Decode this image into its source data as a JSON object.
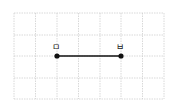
{
  "diagram": {
    "type": "grid-line-segment",
    "grid": {
      "columns": 7,
      "rows": 4,
      "x_lines": [
        14,
        35.5,
        57,
        78.5,
        100,
        121,
        142.5,
        164
      ],
      "y_lines": [
        13,
        35,
        56,
        78,
        99
      ],
      "color": "#cfcfcf"
    },
    "points": [
      {
        "label": "ㅁ",
        "x": 57,
        "y": 56
      },
      {
        "label": "ㅂ",
        "x": 121,
        "y": 56
      }
    ],
    "segment": {
      "from": "ㅁ",
      "to": "ㅂ",
      "color": "#111111"
    }
  }
}
